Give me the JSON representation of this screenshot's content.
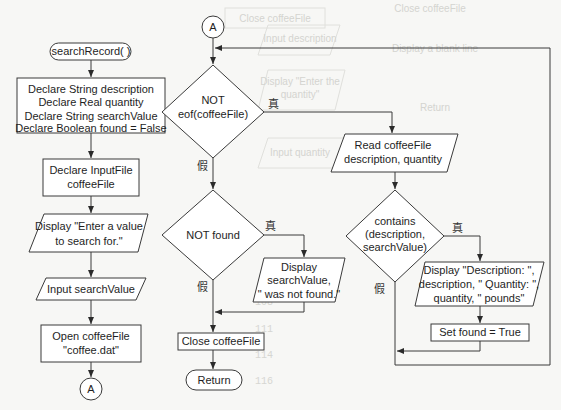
{
  "flowchart": {
    "start": {
      "label": "searchRecord( )"
    },
    "declare_vars": {
      "lines": [
        "Declare String description",
        "Declare Real quantity",
        "Declare String searchValue",
        "Declare Boolean found = False"
      ]
    },
    "declare_file": {
      "lines": [
        "Declare InputFile",
        "coffeeFile"
      ]
    },
    "display_prompt": {
      "lines": [
        "Display \"Enter a value",
        "to search for.\""
      ]
    },
    "input_search": {
      "label": "Input searchValue"
    },
    "open_file": {
      "lines": [
        "Open coffeeFile",
        "\"coffee.dat\""
      ]
    },
    "connector_bottom": {
      "label": "A"
    },
    "connector_top": {
      "label": "A"
    },
    "loop_condition": {
      "lines": [
        "NOT",
        "eof(coffeeFile)"
      ],
      "true_label": "真",
      "false_label": "假"
    },
    "read_record": {
      "lines": [
        "Read coffeeFile",
        "description, quantity"
      ]
    },
    "contains_condition": {
      "lines": [
        "contains",
        "(description,",
        "searchValue)"
      ],
      "true_label": "真",
      "false_label": "假"
    },
    "display_record": {
      "lines": [
        "Display \"Description: \",",
        "description, \" Quantity: \",",
        "quantity, \" pounds\""
      ]
    },
    "set_found": {
      "label": "Set found = True"
    },
    "not_found_condition": {
      "label": "NOT found",
      "true_label": "真",
      "false_label": "假"
    },
    "display_not_found": {
      "lines": [
        "Display",
        "searchValue,",
        "\" was not found.\""
      ]
    },
    "close_file": {
      "label": "Close coffeeFile"
    },
    "end": {
      "label": "Return"
    }
  },
  "background_ghost": {
    "items": [
      "Close coffeeFile",
      "Input description",
      "Display \"Enter the",
      "quantity\"",
      "Input quantity",
      "Display a blank line",
      "Return"
    ],
    "code_lines": [
      "108",
      "109",
      "110",
      "111",
      "112",
      "113",
      "114",
      "115",
      "116"
    ]
  }
}
